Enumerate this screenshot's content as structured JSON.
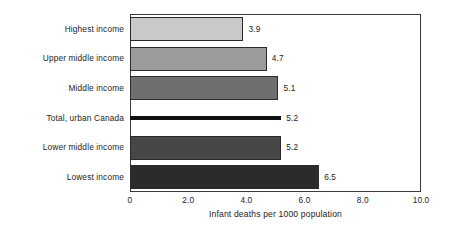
{
  "chart_data": {
    "type": "bar",
    "orientation": "horizontal",
    "title": "",
    "xlabel": "Infant deaths per 1000 population",
    "ylabel": "",
    "xlim": [
      0,
      10
    ],
    "grid": false,
    "legend": "none",
    "categories": [
      "Highest income",
      "Upper middle income",
      "Total, urban Canada",
      "Middle income",
      "Lower middle income",
      "Lowest income"
    ],
    "xticks": [
      "0",
      "2.0",
      "4.0",
      "6.0",
      "8.0",
      "10.0"
    ],
    "xtick_values": [
      0,
      2,
      4,
      6,
      8,
      10
    ],
    "bars": [
      {
        "label": "Highest income",
        "value": 3.9,
        "value_text": "3.9",
        "color": "#c9c9c9",
        "style": "block"
      },
      {
        "label": "Upper middle income",
        "value": 4.7,
        "value_text": "4.7",
        "color": "#9b9b9b",
        "style": "block"
      },
      {
        "label": "Middle income",
        "value": 5.1,
        "value_text": "5.1",
        "color": "#6f6f6f",
        "style": "block"
      },
      {
        "label": "Total, urban Canada",
        "value": 5.2,
        "value_text": "5.2",
        "color": "#111111",
        "style": "line"
      },
      {
        "label": "Lower middle income",
        "value": 5.2,
        "value_text": "5.2",
        "color": "#474747",
        "style": "block"
      },
      {
        "label": "Lowest income",
        "value": 6.5,
        "value_text": "6.5",
        "color": "#2b2b2b",
        "style": "block"
      }
    ]
  }
}
